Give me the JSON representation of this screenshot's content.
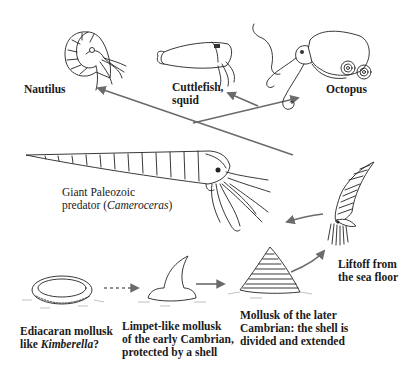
{
  "diagram": {
    "nodes": [
      {
        "id": "nautilus",
        "label_lines": [
          "Nautilus"
        ],
        "icon": "nautilus-illustration"
      },
      {
        "id": "cuttlefish",
        "label_lines": [
          "Cuttlefish,",
          "squid"
        ],
        "icon": "cuttlefish-illustration"
      },
      {
        "id": "octopus",
        "label_lines": [
          "Octopus"
        ],
        "icon": "octopus-illustration"
      },
      {
        "id": "cameroceras",
        "label_lines": [
          "Giant Paleozoic",
          "predator ("
        ],
        "label_italic": "Cameroceras",
        "label_suffix": ")",
        "icon": "cameroceras-illustration"
      },
      {
        "id": "liftoff",
        "label_lines": [
          "Liftoff from",
          "the sea floor"
        ],
        "icon": "liftoff-cephalopod-illustration"
      },
      {
        "id": "kimberella",
        "label_lines": [
          "Ediacaran mollusk",
          "like "
        ],
        "label_italic": "Kimberella",
        "label_suffix": "?",
        "icon": "kimberella-illustration"
      },
      {
        "id": "limpet",
        "label_lines": [
          "Limpet-like mollusk",
          "of the early Cambrian,",
          "protected by a shell"
        ],
        "icon": "limpet-illustration"
      },
      {
        "id": "later-cambrian",
        "label_lines": [
          "Mollusk of the later",
          "Cambrian: the shell is",
          "divided and extended"
        ],
        "icon": "conical-shell-mollusk-illustration"
      }
    ],
    "edges": [
      {
        "from": "kimberella",
        "to": "limpet",
        "style": "dashed"
      },
      {
        "from": "limpet",
        "to": "later-cambrian",
        "style": "solid"
      },
      {
        "from": "later-cambrian",
        "to": "liftoff",
        "style": "solid"
      },
      {
        "from": "liftoff",
        "to": "cameroceras",
        "style": "solid"
      },
      {
        "from": "liftoff",
        "to": "nautilus",
        "style": "solid"
      },
      {
        "from": "branch",
        "to": "cuttlefish",
        "style": "solid"
      },
      {
        "from": "branch",
        "to": "octopus",
        "style": "solid"
      }
    ],
    "colors": {
      "arrow": "#6b6b6b",
      "ink": "#222222",
      "background": "#ffffff"
    }
  }
}
